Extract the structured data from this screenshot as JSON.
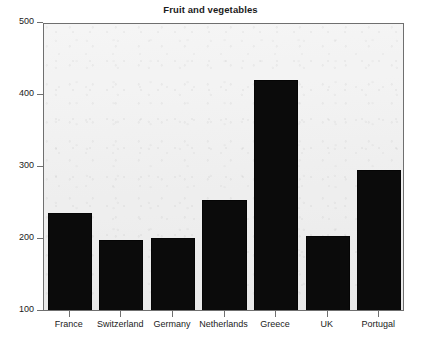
{
  "chart_data": {
    "type": "bar",
    "title": "Fruit and vegetables",
    "subtitle": "",
    "xlabel": "",
    "ylabel": "",
    "categories": [
      "France",
      "Switzerland",
      "Germany",
      "Netherlands",
      "Greece",
      "UK",
      "Portugal"
    ],
    "values": [
      238,
      200,
      203,
      255,
      422,
      206,
      297
    ],
    "ylim": [
      100,
      500
    ],
    "yticks": [
      100,
      200,
      300,
      400,
      500
    ],
    "ytick_labels": [
      "100",
      "200",
      "300",
      "400",
      "500"
    ],
    "grid": false,
    "legend": null,
    "legend_position": "none",
    "bar_color": "#0b0b0b",
    "plot_background": "#eeeeee",
    "frame_color": "#6f6f6f",
    "text_color": "#1b1b1b"
  }
}
